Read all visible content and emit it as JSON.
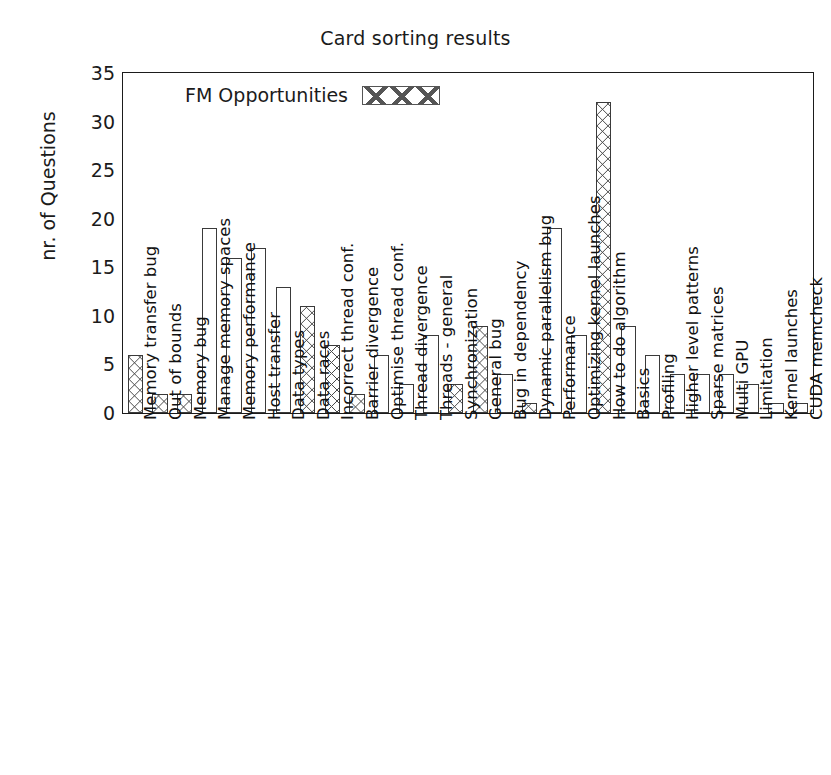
{
  "chart_data": {
    "type": "bar",
    "title": "Card sorting results",
    "xlabel": "",
    "ylabel": "nr. of Questions",
    "ylim": [
      0,
      35
    ],
    "yticks": [
      0,
      5,
      10,
      15,
      20,
      25,
      30,
      35
    ],
    "grid": false,
    "legend": {
      "position": "top-left-inside",
      "entries": [
        {
          "label": "FM Opportunities",
          "pattern": "crosshatch"
        }
      ]
    },
    "series_note": "Bars marked as FM Opportunities are drawn with a crosshatch pattern; all other bars are plain outlines.",
    "categories": [
      "Memory transfer bug",
      "Out of bounds",
      "Memory bug",
      "Manage memory spaces",
      "Memory performance",
      "Host transfer",
      "Data types",
      "Data races",
      "Incorrect thread conf.",
      "Barrier divergence",
      "Optimise thread conf.",
      "Thread divergence",
      "Threads - general",
      "Synchronization",
      "General bug",
      "Bug in dependency",
      "Dynamic parallelism bug",
      "Performance",
      "Optimizing kernel launches",
      "How to do algorithm",
      "Basics",
      "Profiling",
      "Higher level patterns",
      "Sparse matrices",
      "Multi GPU",
      "Limitation",
      "Kernel launches",
      "CUDA memcheck"
    ],
    "values": [
      6,
      2,
      2,
      19,
      16,
      17,
      13,
      11,
      7,
      2,
      6,
      3,
      8,
      3,
      9,
      4,
      1,
      19,
      8,
      32,
      9,
      6,
      4,
      4,
      4,
      3,
      1,
      1
    ],
    "fm_opportunity": [
      true,
      true,
      true,
      false,
      false,
      false,
      false,
      true,
      true,
      true,
      false,
      false,
      false,
      true,
      true,
      false,
      true,
      false,
      false,
      true,
      false,
      false,
      false,
      false,
      false,
      false,
      false,
      false
    ]
  },
  "style": {
    "axis_color": "#1b1b1b",
    "bar_edge_color": "#3a3a3a",
    "bar_fill_color": "#ffffff",
    "hatch_color": "#4a4a4a",
    "background": "#ffffff"
  }
}
